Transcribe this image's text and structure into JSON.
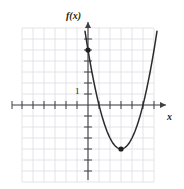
{
  "figure": {
    "background_color": "#ffffff",
    "grid_color": "#dcdde3",
    "axis_color": "#3f3f44",
    "curve_color": "#2d2a2b",
    "point_color": "#231f20",
    "text_color": "#231f20"
  },
  "labels": {
    "y_axis": "f(x)",
    "x_axis": "x",
    "y_tick_one": "1"
  },
  "icons": {
    "y_axis_arrow": "arrow-up-icon",
    "x_axis_arrow": "arrow-right-icon",
    "vertex_marker": "data-point-icon",
    "intercept_marker": "data-point-icon"
  },
  "chart_data": {
    "type": "line",
    "title": "",
    "subtitle": "",
    "xlabel": "x",
    "ylabel": "f(x)",
    "grid": true,
    "legend_position": "none",
    "xlim": [
      -6.5,
      6.5
    ],
    "ylim": [
      -7,
      7
    ],
    "xticks": [
      -6,
      -5,
      -4,
      -3,
      -2,
      -1,
      1,
      2,
      3,
      4,
      5,
      6
    ],
    "yticks": [
      -6,
      -5,
      -4,
      -3,
      -2,
      -1,
      1,
      2,
      3,
      4,
      5,
      6
    ],
    "xtick_labels": [
      "",
      "",
      "",
      "",
      "",
      "",
      "",
      "",
      "",
      "",
      "",
      ""
    ],
    "ytick_labels": [
      "",
      "",
      "",
      "",
      "",
      "1",
      "",
      "",
      "",
      "",
      ""
    ],
    "annotations": [
      {
        "text": "1",
        "x": -0.55,
        "y": 1.1,
        "note": "unit tick label left of y-axis"
      }
    ],
    "series": [
      {
        "name": "f(x)",
        "type": "parabola",
        "equation": "f(x) = (x - 3)^2 - 4",
        "vertex": [
          3,
          -4
        ],
        "y_intercept": [
          0,
          5
        ],
        "x_intercepts": [
          1,
          5
        ],
        "a": 1,
        "x": [
          -0.45,
          0,
          0.5,
          1,
          1.5,
          2,
          2.5,
          3,
          3.5,
          4,
          4.5,
          5,
          5.5,
          6,
          6.2
        ],
        "values": [
          7.9,
          5,
          2.25,
          0,
          -1.75,
          -3,
          -3.75,
          -4,
          -3.75,
          -3,
          -1.75,
          0,
          2.25,
          5,
          6.24
        ]
      }
    ],
    "marked_points": [
      {
        "label": "",
        "x": 0,
        "y": 5
      },
      {
        "label": "",
        "x": 3,
        "y": -4
      }
    ]
  }
}
